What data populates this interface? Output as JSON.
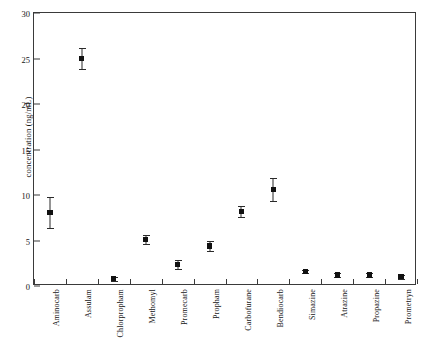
{
  "chart_data": {
    "type": "scatter",
    "title": "",
    "xlabel": "",
    "ylabel": "concentration (ng/mL)",
    "ylim": [
      0,
      30
    ],
    "yticks": [
      0,
      5,
      10,
      15,
      20,
      25,
      30
    ],
    "ytick_labels": [
      "0",
      "5",
      "10",
      "15",
      "20",
      "25",
      "30"
    ],
    "grid": false,
    "legend": "none",
    "marker": "filled-square",
    "error_bars": "symmetric",
    "categories": [
      "Aminocarb",
      "Assulam",
      "Chlorpropham",
      "Methomyl",
      "Promecarb",
      "Propham",
      "Carbofurane",
      "Bendiocarb",
      "Simazine",
      "Atrazine",
      "Propazine",
      "Prometryn"
    ],
    "values": [
      8.1,
      25.0,
      0.8,
      5.1,
      2.4,
      4.4,
      8.2,
      10.6,
      1.6,
      1.2,
      1.2,
      1.0
    ],
    "errors": [
      1.7,
      1.2,
      0.2,
      0.5,
      0.5,
      0.5,
      0.6,
      1.3,
      0.2,
      0.2,
      0.2,
      0.2
    ]
  }
}
